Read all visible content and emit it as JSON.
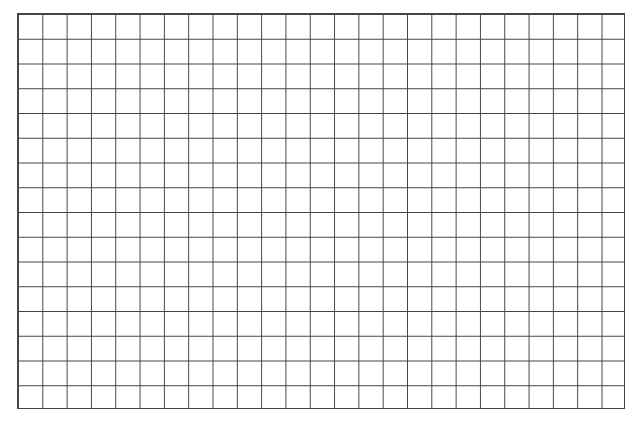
{
  "grid": {
    "columns": 25,
    "rows": 16,
    "line_color": "#444444",
    "background": "#ffffff"
  }
}
